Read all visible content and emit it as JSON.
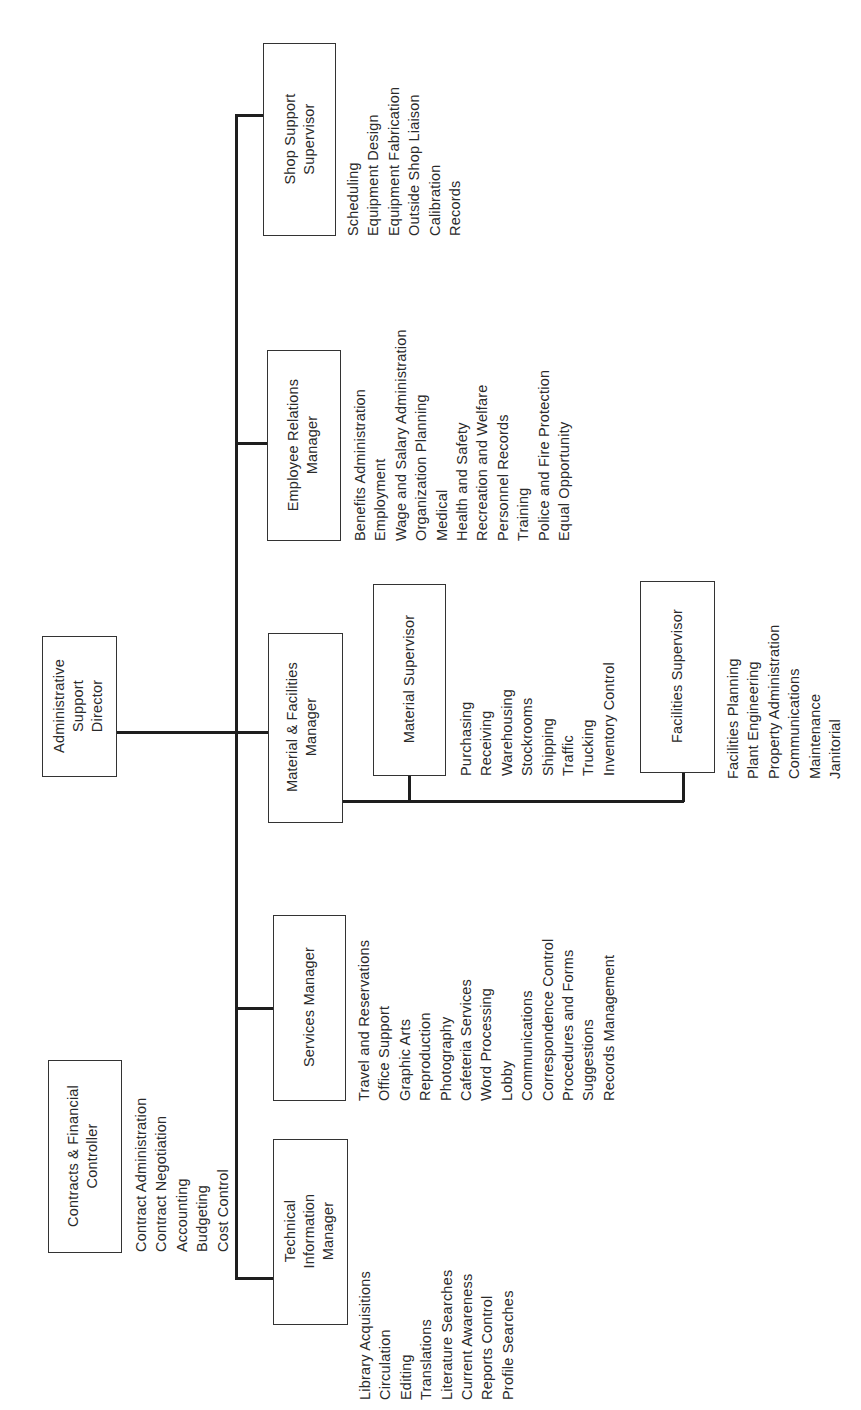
{
  "chart_title": "",
  "orientation": "rotated -90deg (text reads bottom-to-top)",
  "root": {
    "id": "director",
    "title_lines": [
      "Administrative",
      "Support",
      "Director"
    ]
  },
  "staff": {
    "id": "contracts",
    "title_lines": [
      "Contracts & Financial",
      "Controller"
    ],
    "functions": [
      "Contract Administration",
      "Contract Negotiation",
      "Accounting",
      "Budgeting",
      "Cost Control"
    ]
  },
  "managers": [
    {
      "id": "technical-information",
      "title_lines": [
        "Technical",
        "Information",
        "Manager"
      ],
      "functions": [
        "Library Acquisitions",
        "Circulation",
        "Editing",
        "Translations",
        "Literature Searches",
        "Current Awareness",
        "Reports Control",
        "Profile Searches"
      ]
    },
    {
      "id": "services",
      "title_lines": [
        "Services Manager"
      ],
      "functions": [
        "Travel and Reservations",
        "Office Support",
        "Graphic Arts",
        "Reproduction",
        "Photography",
        "Cafeteria Services",
        "Word Processing",
        "Lobby",
        "Communications",
        "Correspondence Control",
        "Procedures and Forms",
        "Suggestions",
        "Records Management"
      ]
    },
    {
      "id": "material-facilities",
      "title_lines": [
        "Material & Facilities",
        "Manager"
      ],
      "supervisors": [
        {
          "id": "material",
          "title_lines": [
            "Material Supervisor"
          ],
          "functions": [
            "Purchasing",
            "Receiving",
            "Warehousing",
            "Stockrooms",
            "Shipping",
            "Traffic",
            "Trucking",
            "Inventory Control"
          ]
        },
        {
          "id": "facilities",
          "title_lines": [
            "Facilities Supervisor"
          ],
          "functions": [
            "Facilities Planning",
            "Plant Engineering",
            "Property Administration",
            "Communications",
            "Maintenance",
            "Janitorial"
          ]
        }
      ]
    },
    {
      "id": "employee-relations",
      "title_lines": [
        "Employee Relations",
        "Manager"
      ],
      "functions": [
        "Benefits Administration",
        "Employment",
        "Wage and Salary Administration",
        "Organization Planning",
        "Medical",
        "Health and Safety",
        "Recreation and Welfare",
        "Personnel Records",
        "Training",
        "Police and Fire Protection",
        "Equal Opportunity"
      ]
    },
    {
      "id": "shop-support",
      "title_lines": [
        "Shop Support",
        "Supervisor"
      ],
      "functions": [
        "Scheduling",
        "Equipment Design",
        "Equipment Fabrication",
        "Outside Shop Liaison",
        "Calibration",
        "Records"
      ]
    }
  ],
  "colors": {
    "line": "#1e1e1e",
    "box_border": "#333333",
    "text": "#2a2a2a",
    "background": "#ffffff"
  }
}
